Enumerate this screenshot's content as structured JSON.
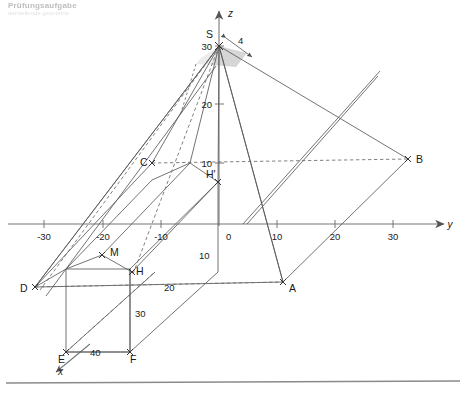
{
  "header": {
    "line1": "Prüfungsaufgabe",
    "line2": "darstellende geometrie"
  },
  "figure": {
    "background": "#ffffff",
    "line_color": "#5a5a5a",
    "axis_color": "#777777",
    "shade_fill": "#cfcfcf",
    "bottom_rule_color": "#8a8a8a"
  },
  "axes": {
    "y": {
      "label": "y",
      "ticks": [
        "-30",
        "-20",
        "-10",
        "0",
        "10",
        "20",
        "30"
      ],
      "arrow": "arrow-right"
    },
    "z": {
      "label": "z",
      "ticks": [
        "10",
        "20",
        "30"
      ],
      "arrow": "arrow-up"
    },
    "x": {
      "label": "x",
      "ticks": [],
      "arrow": "arrow-down-left"
    }
  },
  "points": [
    {
      "id": "S",
      "label": "S"
    },
    {
      "id": "A",
      "label": "A"
    },
    {
      "id": "B",
      "label": "B"
    },
    {
      "id": "C",
      "label": "C"
    },
    {
      "id": "D",
      "label": "D"
    },
    {
      "id": "E",
      "label": "E"
    },
    {
      "id": "F",
      "label": "F"
    },
    {
      "id": "H",
      "label": "H"
    },
    {
      "id": "H2",
      "label": "H'"
    },
    {
      "id": "M",
      "label": "M"
    }
  ],
  "dimensions": [
    {
      "id": "apex-offset",
      "value": "4"
    },
    {
      "id": "depth",
      "value": "40"
    },
    {
      "id": "height",
      "value": "30"
    },
    {
      "id": "width",
      "value": "20"
    },
    {
      "id": "roof",
      "value": "10"
    },
    {
      "id": "apex-height",
      "value": "30"
    }
  ],
  "tick_labels": {
    "y_neg30": "-30",
    "y_neg20": "-20",
    "y_neg10": "-10",
    "origin": "0",
    "y_10": "10",
    "y_20": "20",
    "y_30": "30",
    "z_10": "10",
    "z_20": "20",
    "z_30": "30"
  }
}
